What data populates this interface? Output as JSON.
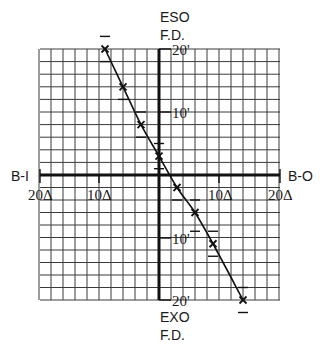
{
  "chart_data": {
    "type": "line",
    "title": "",
    "xlabel_left": "B-I",
    "xlabel_right": "B-O",
    "ylabel_top": [
      "ESO",
      "F.D."
    ],
    "ylabel_bottom": [
      "EXO",
      "F.D."
    ],
    "x_unit": "prism diopters (Δ)",
    "y_unit": "minutes of arc (')",
    "xlim": [
      -20,
      20
    ],
    "ylim": [
      -20,
      20
    ],
    "x_tick_labels": [
      {
        "value": -20,
        "label": "20Δ"
      },
      {
        "value": -10,
        "label": "10Δ"
      },
      {
        "value": 10,
        "label": "10Δ"
      },
      {
        "value": 20,
        "label": "20Δ"
      }
    ],
    "y_tick_labels": [
      {
        "value": 20,
        "label": "20'"
      },
      {
        "value": 10,
        "label": "10'"
      },
      {
        "value": -10,
        "label": "10'"
      },
      {
        "value": -20,
        "label": "20'"
      }
    ],
    "grid": true,
    "grid_step_x": 2,
    "grid_step_y": 2,
    "legend": null,
    "series": [
      {
        "name": "Fixation disparity curve",
        "marker": "x",
        "x": [
          -9,
          -6,
          -3,
          0,
          3,
          6,
          9,
          14
        ],
        "y": [
          20,
          14,
          8,
          3,
          -2,
          -6,
          -11,
          -20
        ]
      }
    ],
    "error_dashes": [
      {
        "x": -9,
        "y": 22
      },
      {
        "x": -9,
        "y": 18
      },
      {
        "x": -6,
        "y": 12
      },
      {
        "x": -3,
        "y": 10
      },
      {
        "x": -3,
        "y": 6
      },
      {
        "x": 0,
        "y": 5
      },
      {
        "x": 0,
        "y": 1
      },
      {
        "x": 3,
        "y": -4
      },
      {
        "x": 6,
        "y": -4
      },
      {
        "x": 6,
        "y": -9
      },
      {
        "x": 9,
        "y": -9
      },
      {
        "x": 9,
        "y": -13
      },
      {
        "x": 14,
        "y": -18
      },
      {
        "x": 14,
        "y": -22
      }
    ]
  },
  "labels": {
    "eso": "ESO",
    "eso_fd": "F.D.",
    "exo": "EXO",
    "exo_fd": "F.D.",
    "bi": "B-I",
    "bo": "B-O",
    "x_left_20": "20Δ",
    "x_left_10": "10Δ",
    "x_right_10": "10Δ",
    "x_right_20": "20Δ",
    "y_top_20": "20'",
    "y_top_10": "10'",
    "y_bottom_10": "10'",
    "y_bottom_20": "20'"
  }
}
